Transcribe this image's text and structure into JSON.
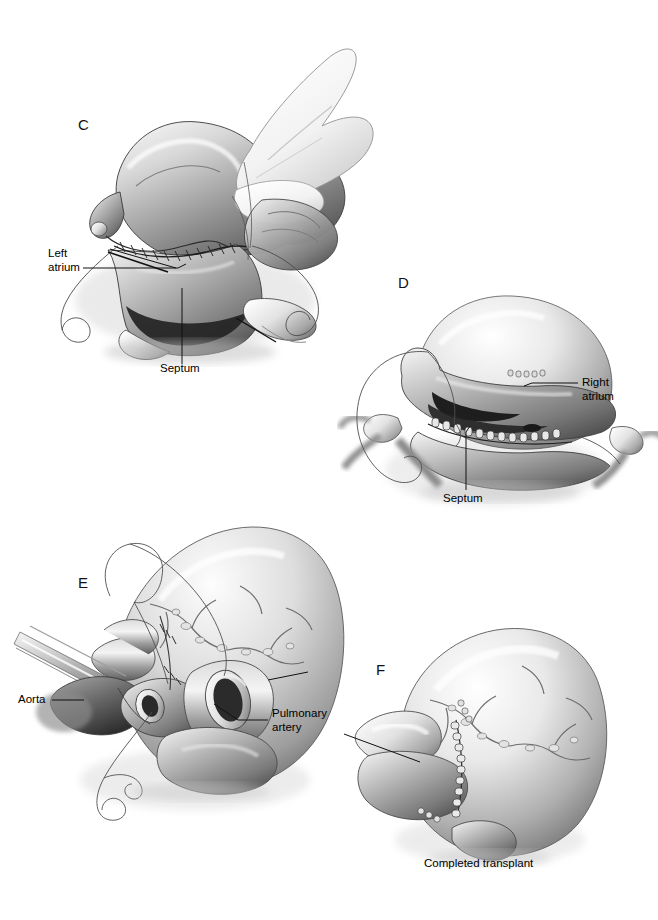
{
  "figure": {
    "background_color": "#ffffff",
    "ink_color": "#111111",
    "rendering": "grayscale medical illustration"
  },
  "panels": [
    {
      "letter": "C",
      "name": "left-atrial-anastomosis",
      "description": "Donor heart held by surgeon's hand; left atrial suture line being completed with running suture; recipient left atrial cuff and interatrial septum exposed.",
      "labels": [
        {
          "id": "left-atrium",
          "text": "Left\natrium"
        },
        {
          "id": "septum",
          "text": "Septum"
        }
      ]
    },
    {
      "letter": "D",
      "name": "right-atrial-anastomosis",
      "description": "Right atrial anastomosis in progress with running suture along the cut edge; septum visible below.",
      "labels": [
        {
          "id": "right-atrium",
          "text": "Right\natrium"
        },
        {
          "id": "septum",
          "text": "Septum"
        }
      ]
    },
    {
      "letter": "E",
      "name": "great-vessel-anastomoses",
      "description": "Aorta clamped and pulmonary artery anastomosis being performed; suture loops visible.",
      "labels": [
        {
          "id": "aorta",
          "text": "Aorta"
        },
        {
          "id": "pulmonary-artery",
          "text": "Pulmonary\nartery"
        }
      ]
    },
    {
      "letter": "F",
      "name": "completed-transplant",
      "description": "Completed orthotopic heart transplant with all four suture lines finished.",
      "labels": [],
      "caption": "Completed transplant"
    }
  ],
  "labels_flat": {
    "left_atrium": "Left\natrium",
    "septum_c": "Septum",
    "right_atrium": "Right\natrium",
    "septum_d": "Septum",
    "aorta": "Aorta",
    "pulmonary_artery": "Pulmonary\nartery",
    "completed_transplant": "Completed transplant"
  },
  "panel_letters": {
    "c": "C",
    "d": "D",
    "e": "E",
    "f": "F"
  }
}
